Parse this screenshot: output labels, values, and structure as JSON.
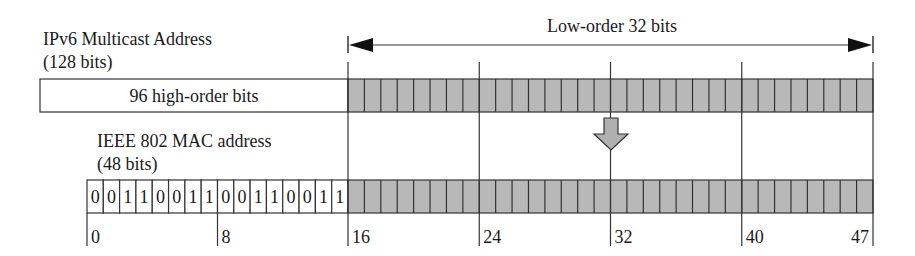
{
  "title_ipv6": "IPv6 Multicast Address",
  "subtitle_ipv6": "(128 bits)",
  "high_order_label": "96 high-order bits",
  "low_order_label": "Low-order 32 bits",
  "title_mac": "IEEE 802 MAC address",
  "subtitle_mac": "(48 bits)",
  "mac_prefix_bits": [
    "0",
    "0",
    "1",
    "1",
    "0",
    "0",
    "1",
    "1",
    "0",
    "0",
    "1",
    "1",
    "0",
    "0",
    "1",
    "1"
  ],
  "low_order_bit_count": 32,
  "bit_ticks": [
    {
      "label": "0",
      "bit": 0
    },
    {
      "label": "8",
      "bit": 8
    },
    {
      "label": "16",
      "bit": 16
    },
    {
      "label": "24",
      "bit": 24
    },
    {
      "label": "32",
      "bit": 32
    },
    {
      "label": "40",
      "bit": 40
    },
    {
      "label": "47",
      "bit": 47
    }
  ],
  "colors": {
    "shaded_cell": "#b8b8b8",
    "line": "#333333",
    "arrow_fill": "#b0b0b0"
  }
}
